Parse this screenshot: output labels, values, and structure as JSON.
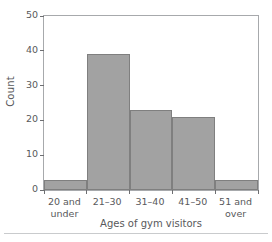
{
  "chart_data": {
    "type": "bar",
    "title": "",
    "subtitle": "",
    "xlabel": "Ages of gym visitors",
    "ylabel": "Count",
    "categories": [
      "20 and under",
      "21–30",
      "31–40",
      "41–50",
      "51 and over"
    ],
    "category_lines": [
      [
        "20 and",
        "under"
      ],
      [
        "21–30",
        ""
      ],
      [
        "31–40",
        ""
      ],
      [
        "41–50",
        ""
      ],
      [
        "51 and",
        "over"
      ]
    ],
    "values": [
      3,
      39,
      23,
      21,
      3
    ],
    "ylim": [
      0,
      50
    ],
    "yticks": [
      0,
      10,
      20,
      30,
      40,
      50
    ],
    "ytick_labels": [
      "0",
      "10",
      "20",
      "30",
      "40",
      "50"
    ],
    "grid": false,
    "legend": "none",
    "bar_fill": "#a2a2a2",
    "bar_edge": "#7f7f7f",
    "axis_color": "#a7a9ac",
    "text_color": "#58595b"
  },
  "footer": {
    "caption": ""
  }
}
